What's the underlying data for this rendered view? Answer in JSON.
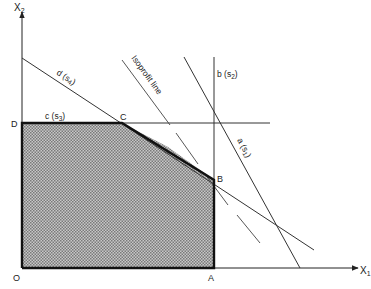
{
  "diagram": {
    "type": "linear-programming-feasible-region",
    "axes": {
      "x_label": "X",
      "x_sub": "1",
      "y_label": "X",
      "y_sub": "2",
      "origin_label": "O"
    },
    "vertices": [
      {
        "id": "O",
        "label": "O"
      },
      {
        "id": "A",
        "label": "A"
      },
      {
        "id": "B",
        "label": "B"
      },
      {
        "id": "C",
        "label": "C"
      },
      {
        "id": "D",
        "label": "D"
      }
    ],
    "constraints": [
      {
        "id": "a",
        "label": "a (s",
        "sub": "1",
        "close": ")"
      },
      {
        "id": "b",
        "label": "b (s",
        "sub": "2",
        "close": ")"
      },
      {
        "id": "c",
        "label": "c (s",
        "sub": "3",
        "close": ")"
      },
      {
        "id": "d",
        "label": "d (s",
        "sub": "4",
        "close": ")"
      }
    ],
    "isoprofit_label": "Isoprofit line",
    "colors": {
      "line": "#333333",
      "boundary": "#111111",
      "fill_dark": "#7a7a7a",
      "fill_light": "#c8c8c8"
    }
  }
}
